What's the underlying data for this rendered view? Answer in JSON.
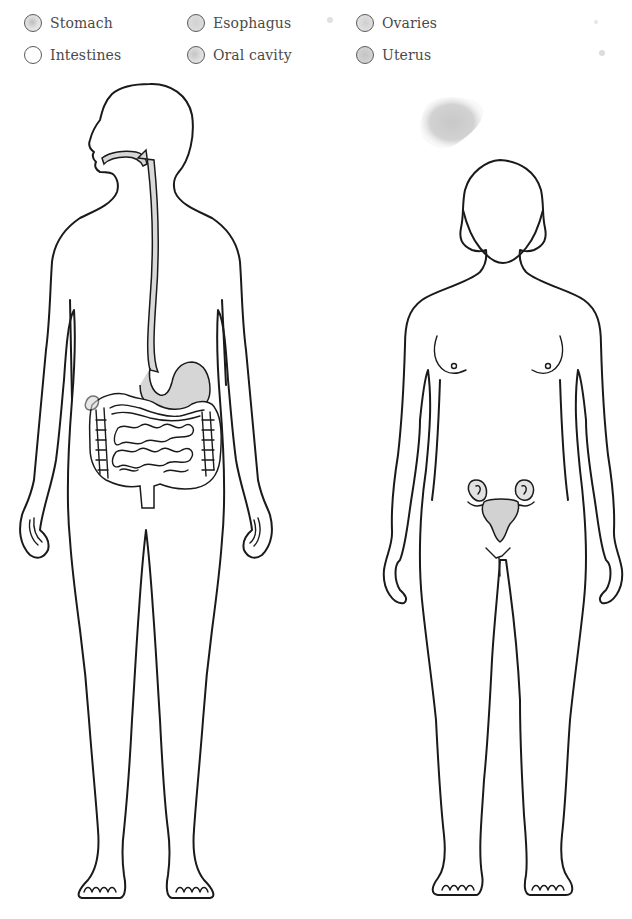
{
  "legend": {
    "items": [
      {
        "label": "Stomach",
        "color": "#cfcfcf",
        "fill": "radial"
      },
      {
        "label": "Esophagus",
        "color": "#d6d6d6",
        "fill": "solid"
      },
      {
        "label": "Ovaries",
        "color": "#dadada",
        "fill": "solid"
      },
      {
        "label": "Intestines",
        "color": "#ffffff",
        "fill": "none"
      },
      {
        "label": "Oral cavity",
        "color": "#d4d4d4",
        "fill": "radial"
      },
      {
        "label": "Uterus",
        "color": "#cccccc",
        "fill": "solid"
      }
    ]
  },
  "figures": {
    "male": {
      "label": "Male figure with digestive tract (oral cavity, esophagus, stomach, intestines)"
    },
    "female": {
      "label": "Female figure with reproductive organs (ovaries, uterus)"
    }
  },
  "colors": {
    "line": "#1a1a1a",
    "organ_fill": "#d9d9d9",
    "stain": "#cfcfcf",
    "background": "#ffffff"
  }
}
